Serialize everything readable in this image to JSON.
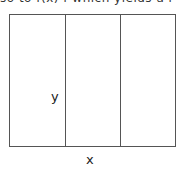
{
  "header_fragment": "so to f(x)      f which yields a r",
  "diagram": {
    "type": "rectangle divided into three vertical strips",
    "strips": 3,
    "labels": {
      "y": "y",
      "x": "x"
    },
    "colors": {
      "stroke": "#555555",
      "background": "#ffffff",
      "text": "#222222"
    }
  }
}
